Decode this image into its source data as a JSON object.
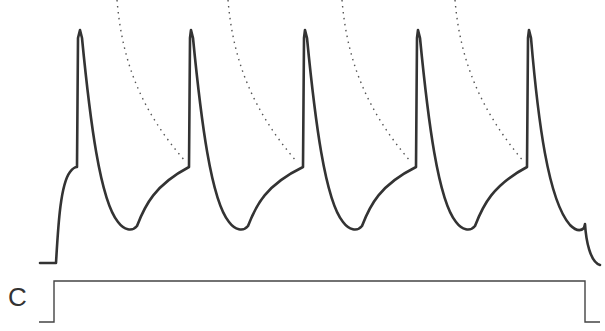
{
  "figure": {
    "stimulus_label": "C",
    "colors": {
      "trace": "#333333",
      "stimulus": "#444444",
      "guide": "#555555"
    },
    "spike_peaks_x": [
      80,
      191,
      305,
      418,
      529
    ],
    "spike_count": 5
  }
}
